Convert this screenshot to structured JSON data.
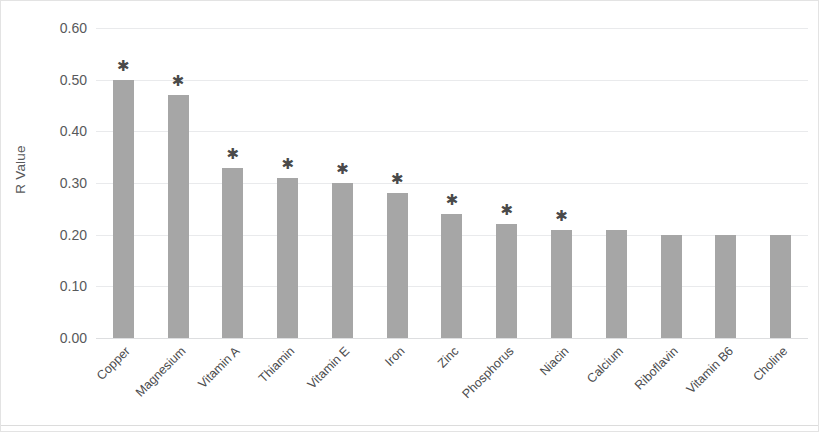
{
  "chart_data": {
    "type": "bar",
    "title": "",
    "xlabel": "",
    "ylabel": "R Value",
    "ylim": [
      0.0,
      0.6
    ],
    "ytick_labels": [
      "0.60",
      "0.50",
      "0.40",
      "0.30",
      "0.20",
      "0.10",
      "0.00"
    ],
    "yticks": [
      0.6,
      0.5,
      0.4,
      0.3,
      0.2,
      0.1,
      0.0
    ],
    "grid": true,
    "legend": "none",
    "significance_symbol": "✱",
    "categories": [
      "Copper",
      "Magnesium",
      "Vitamin A",
      "Thiamin",
      "Vitamin E",
      "Iron",
      "Zinc",
      "Phosphorus",
      "Niacin",
      "Calcium",
      "Riboflavin",
      "Vitamin B6",
      "Choline"
    ],
    "values": [
      0.5,
      0.47,
      0.33,
      0.31,
      0.3,
      0.28,
      0.24,
      0.22,
      0.21,
      0.21,
      0.2,
      0.2,
      0.2
    ],
    "significant": [
      true,
      true,
      true,
      true,
      true,
      true,
      true,
      true,
      true,
      false,
      false,
      false,
      false
    ],
    "bar_color": "#a6a6a6",
    "gridline_color": "#e9eaec",
    "text_color": "#58595b"
  }
}
